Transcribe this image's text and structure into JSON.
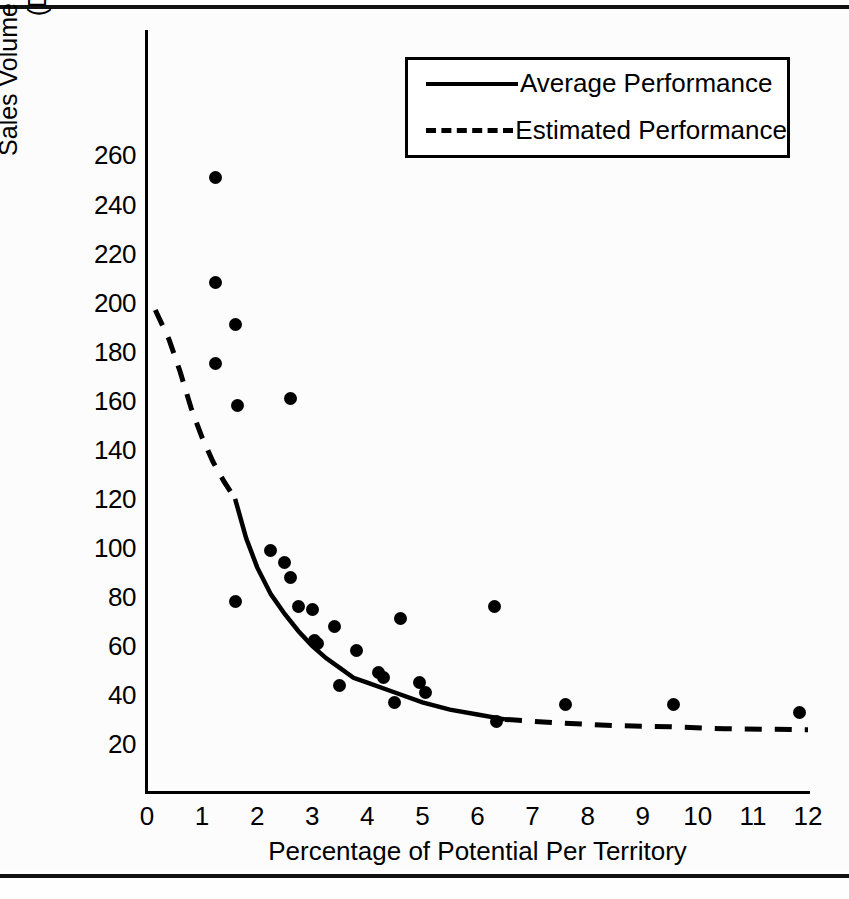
{
  "figure": {
    "has_top_rule": true,
    "has_bottom_rule": true,
    "background": "#fcfcfc",
    "ink_color": "#000000"
  },
  "legend": {
    "position": "upper-right-inside",
    "entries": [
      {
        "label": "Average Performance",
        "style": "solid"
      },
      {
        "label": "Estimated Performance",
        "style": "dashed"
      }
    ]
  },
  "axis": {
    "y_title_line1": "Sales Volume Per 1% of Potential",
    "y_title_line2": "(Dollars)",
    "x_title": "Percentage of Potential Per Territory",
    "y_ticks": [
      "260",
      "240",
      "220",
      "200",
      "180",
      "160",
      "140",
      "120",
      "100",
      "80",
      "60",
      "40",
      "20"
    ],
    "x_ticks": [
      "0",
      "1",
      "2",
      "3",
      "4",
      "5",
      "6",
      "7",
      "8",
      "9",
      "10",
      "11",
      "12"
    ]
  },
  "chart_data": {
    "type": "scatter",
    "title": "",
    "xlabel": "Percentage of Potential Per Territory",
    "ylabel": "Sales Volume Per 1% of Potential (Dollars)",
    "xlim": [
      0,
      12
    ],
    "ylim": [
      0,
      265
    ],
    "xticks": [
      0,
      1,
      2,
      3,
      4,
      5,
      6,
      7,
      8,
      9,
      10,
      11,
      12
    ],
    "yticks": [
      20,
      40,
      60,
      80,
      100,
      120,
      140,
      160,
      180,
      200,
      220,
      240,
      260
    ],
    "grid": false,
    "legend_position": "upper right",
    "series": [
      {
        "name": "Territory observations",
        "type": "scatter",
        "marker": "filled-circle",
        "points": [
          [
            1.25,
            251
          ],
          [
            1.25,
            208
          ],
          [
            1.25,
            175
          ],
          [
            1.6,
            191
          ],
          [
            1.65,
            158
          ],
          [
            2.6,
            161
          ],
          [
            1.6,
            78
          ],
          [
            2.25,
            99
          ],
          [
            2.5,
            94
          ],
          [
            2.6,
            88
          ],
          [
            2.75,
            76
          ],
          [
            3.0,
            75
          ],
          [
            3.05,
            62
          ],
          [
            3.1,
            61
          ],
          [
            3.4,
            68
          ],
          [
            3.5,
            44
          ],
          [
            3.8,
            58
          ],
          [
            4.2,
            49
          ],
          [
            4.3,
            47
          ],
          [
            4.5,
            37
          ],
          [
            4.6,
            71
          ],
          [
            4.95,
            45
          ],
          [
            5.05,
            41
          ],
          [
            6.3,
            76
          ],
          [
            6.35,
            29
          ],
          [
            7.6,
            36
          ],
          [
            9.55,
            36
          ],
          [
            11.85,
            33
          ]
        ]
      },
      {
        "name": "Average Performance",
        "type": "line",
        "style": "solid",
        "x_range": [
          1.6,
          6.5
        ],
        "points": [
          [
            1.6,
            120
          ],
          [
            1.8,
            104
          ],
          [
            2.0,
            92
          ],
          [
            2.25,
            81
          ],
          [
            2.5,
            73
          ],
          [
            2.75,
            66
          ],
          [
            3.0,
            60
          ],
          [
            3.25,
            55
          ],
          [
            3.5,
            51
          ],
          [
            3.75,
            47
          ],
          [
            4.0,
            45
          ],
          [
            4.5,
            41
          ],
          [
            5.0,
            37
          ],
          [
            5.5,
            34
          ],
          [
            6.0,
            32
          ],
          [
            6.5,
            30
          ]
        ]
      },
      {
        "name": "Estimated Performance",
        "type": "line",
        "style": "dashed",
        "segments": [
          {
            "x_range": [
              0.15,
              1.6
            ],
            "points": [
              [
                0.15,
                197
              ],
              [
                0.4,
                185
              ],
              [
                0.6,
                172
              ],
              [
                0.8,
                157
              ],
              [
                1.0,
                145
              ],
              [
                1.2,
                135
              ],
              [
                1.4,
                127
              ],
              [
                1.6,
                120
              ]
            ]
          },
          {
            "x_range": [
              6.5,
              12.0
            ],
            "points": [
              [
                6.5,
                30
              ],
              [
                7.5,
                28.5
              ],
              [
                8.5,
                27.5
              ],
              [
                9.5,
                27
              ],
              [
                10.5,
                26.2
              ],
              [
                12.0,
                25.8
              ]
            ]
          }
        ]
      }
    ]
  }
}
